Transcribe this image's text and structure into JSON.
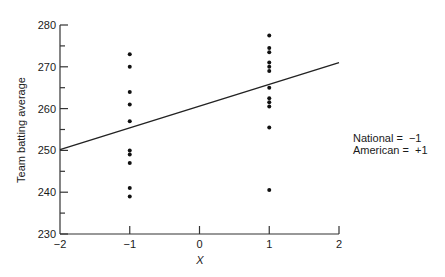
{
  "chart_data": {
    "type": "scatter",
    "title": "",
    "xlabel": "X",
    "ylabel": "Team batting average",
    "xlim": [
      -2,
      2
    ],
    "ylim": [
      230,
      280
    ],
    "x_ticks": [
      -2,
      -1,
      0,
      1,
      2
    ],
    "x_tick_labels": [
      "−2",
      "−1",
      "0",
      "1",
      "2"
    ],
    "y_ticks": [
      230,
      240,
      250,
      260,
      270,
      280
    ],
    "y_minor_ticks": [
      235,
      245,
      255,
      265,
      275
    ],
    "grid": false,
    "series": [
      {
        "name": "National",
        "x": [
          -1,
          -1,
          -1,
          -1,
          -1,
          -1,
          -1,
          -1,
          -1,
          -1
        ],
        "y": [
          273,
          270,
          264,
          261,
          257,
          250,
          249,
          247,
          241,
          239
        ]
      },
      {
        "name": "American",
        "x": [
          1,
          1,
          1,
          1,
          1,
          1,
          1,
          1,
          1,
          1,
          1,
          1
        ],
        "y": [
          277.5,
          274.5,
          273.5,
          271,
          270,
          269,
          265,
          262.5,
          261.5,
          260.5,
          255.5,
          240.5
        ]
      }
    ],
    "regression_line": {
      "x": [
        -2,
        2
      ],
      "y": [
        250.2,
        271
      ]
    },
    "annotations": [
      {
        "text": "National = −1"
      },
      {
        "text": "American = +1"
      }
    ]
  },
  "legend": {
    "national": "National =  −1",
    "american": "American =  +1"
  },
  "axes": {
    "xlabel": "X",
    "ylabel": "Team batting average"
  }
}
